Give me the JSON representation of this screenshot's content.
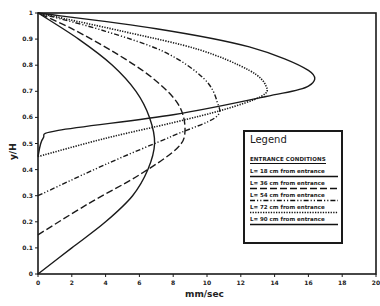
{
  "chart_data": {
    "type": "line",
    "title": "",
    "xlabel": "mm/sec",
    "ylabel": "y/H",
    "xlim": [
      0,
      20
    ],
    "ylim": [
      0,
      1
    ],
    "x_ticks": [
      "0",
      "2",
      "4",
      "6",
      "8",
      "10",
      "12",
      "14",
      "16",
      "18",
      "20"
    ],
    "y_ticks": [
      "0",
      "0.1",
      "0.2",
      "0.3",
      "0.4",
      "0.5",
      "0.6",
      "0.7",
      "0.8",
      "0.9",
      "1"
    ],
    "grid": false,
    "legend_position": "inside-right",
    "legend": {
      "title": "Legend",
      "subtitle": "ENTRANCE CONDITIONS",
      "entries": [
        "L= 18 cm from entrance",
        "L= 36 cm from entrance",
        "L= 54 cm from entrance",
        "L= 72 cm from entrance",
        "L= 90 cm from entrance"
      ]
    },
    "series": [
      {
        "name": "L= 18 cm from entrance",
        "style": "solid",
        "points": [
          [
            0,
            0
          ],
          [
            2,
            0.1
          ],
          [
            4,
            0.2
          ],
          [
            5.6,
            0.3
          ],
          [
            6.5,
            0.4
          ],
          [
            6.9,
            0.5
          ],
          [
            6.6,
            0.6
          ],
          [
            5.8,
            0.7
          ],
          [
            4.4,
            0.8
          ],
          [
            2.4,
            0.9
          ],
          [
            0,
            1
          ]
        ]
      },
      {
        "name": "L= 36 cm from entrance",
        "style": "long-dash",
        "points": [
          [
            0,
            0.15
          ],
          [
            3,
            0.27
          ],
          [
            6,
            0.38
          ],
          [
            8.2,
            0.48
          ],
          [
            8.7,
            0.55
          ],
          [
            8.3,
            0.65
          ],
          [
            6.8,
            0.75
          ],
          [
            4.5,
            0.85
          ],
          [
            2,
            0.94
          ],
          [
            0,
            1
          ]
        ]
      },
      {
        "name": "L= 54 cm from entrance",
        "style": "dash-dot-dot",
        "points": [
          [
            0,
            0.3
          ],
          [
            4,
            0.42
          ],
          [
            8,
            0.53
          ],
          [
            10.5,
            0.6
          ],
          [
            10.6,
            0.66
          ],
          [
            9.8,
            0.75
          ],
          [
            7.5,
            0.85
          ],
          [
            4,
            0.93
          ],
          [
            0,
            1
          ]
        ]
      },
      {
        "name": "L= 72 cm from entrance",
        "style": "dotted",
        "points": [
          [
            0,
            0.45
          ],
          [
            4,
            0.52
          ],
          [
            8,
            0.58
          ],
          [
            11,
            0.63
          ],
          [
            13.2,
            0.68
          ],
          [
            13.5,
            0.72
          ],
          [
            12.5,
            0.78
          ],
          [
            9.5,
            0.86
          ],
          [
            5,
            0.93
          ],
          [
            0,
            1
          ]
        ]
      },
      {
        "name": "L= 90 cm from entrance",
        "style": "solid",
        "points": [
          [
            0,
            0.45
          ],
          [
            0.3,
            0.52
          ],
          [
            1.2,
            0.55
          ],
          [
            8,
            0.61
          ],
          [
            13.5,
            0.68
          ],
          [
            16,
            0.72
          ],
          [
            16,
            0.78
          ],
          [
            12.5,
            0.87
          ],
          [
            7,
            0.94
          ],
          [
            0,
            1
          ]
        ]
      }
    ]
  }
}
